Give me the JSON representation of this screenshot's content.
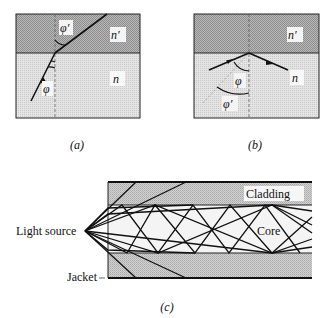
{
  "panels": {
    "a": {
      "caption": "(a)",
      "upper_medium_label": "n′",
      "lower_medium_label": "n",
      "refracted_angle_label": "φ′",
      "incident_angle_label": "φ"
    },
    "b": {
      "caption": "(b)",
      "upper_medium_label": "n′",
      "lower_medium_label": "n",
      "incident_angle_label": "φ",
      "critical_angle_label": "φ′"
    },
    "c": {
      "caption": "(c)",
      "cladding_label": "Cladding",
      "core_label": "Core",
      "source_label": "Light source",
      "jacket_label": "Jacket"
    }
  },
  "colors": {
    "dense_medium": "#a9a9a9",
    "light_medium": "#d9d9d9",
    "cladding": "#c2c2c2",
    "core": "#f4f4f4",
    "line": "#111111"
  }
}
